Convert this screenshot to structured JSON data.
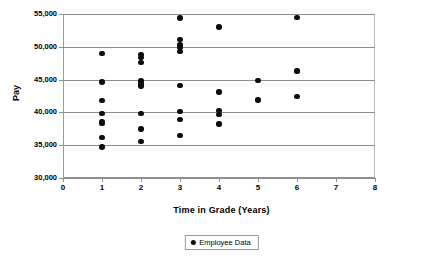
{
  "chart_data": {
    "type": "scatter",
    "title": "",
    "xlabel": "Time in Grade (Years)",
    "ylabel": "Pay",
    "xlim": [
      0,
      8
    ],
    "ylim": [
      30000,
      55000
    ],
    "xticks": [
      "0",
      "1",
      "2",
      "3",
      "4",
      "5",
      "6",
      "7",
      "8"
    ],
    "xtick_values": [
      0,
      1,
      2,
      3,
      4,
      5,
      6,
      7,
      8
    ],
    "yticks": [
      "30,000",
      "35,000",
      "40,000",
      "45,000",
      "50,000",
      "55,000"
    ],
    "ytick_values": [
      30000,
      35000,
      40000,
      45000,
      50000,
      55000
    ],
    "grid": true,
    "grid_axis": "y",
    "legend_position": "bottom-center",
    "marker_color": "#0d0d0d",
    "grid_color": "#8e8e8e",
    "series": [
      {
        "name": "Employee Data",
        "points": [
          [
            1,
            49000
          ],
          [
            1,
            44600
          ],
          [
            1,
            41800
          ],
          [
            1,
            39800
          ],
          [
            1,
            38600
          ],
          [
            1,
            38300
          ],
          [
            1,
            36200
          ],
          [
            1,
            34700
          ],
          [
            2,
            48800
          ],
          [
            2,
            48400
          ],
          [
            2,
            47600
          ],
          [
            2,
            44800
          ],
          [
            2,
            44300
          ],
          [
            2,
            44000
          ],
          [
            2,
            39800
          ],
          [
            2,
            37500
          ],
          [
            2,
            35600
          ],
          [
            3,
            54400
          ],
          [
            3,
            51100
          ],
          [
            3,
            50300
          ],
          [
            3,
            49900
          ],
          [
            3,
            49300
          ],
          [
            3,
            44100
          ],
          [
            3,
            40100
          ],
          [
            3,
            38900
          ],
          [
            3,
            36500
          ],
          [
            4,
            53000
          ],
          [
            4,
            43100
          ],
          [
            4,
            40300
          ],
          [
            4,
            39700
          ],
          [
            4,
            38200
          ],
          [
            5,
            44900
          ],
          [
            5,
            41900
          ],
          [
            6,
            54500
          ],
          [
            6,
            46400
          ],
          [
            6,
            46200
          ],
          [
            6,
            42400
          ]
        ]
      }
    ]
  },
  "legend": {
    "entries": [
      {
        "label": "Employee Data",
        "marker": "filled-circle"
      }
    ]
  }
}
